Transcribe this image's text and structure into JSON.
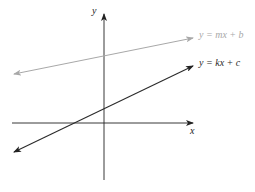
{
  "diagram": {
    "axes": {
      "x_label": "x",
      "y_label": "y",
      "color": "#222222"
    },
    "lines": [
      {
        "name": "gray-line",
        "label_parts": [
          "y",
          " = ",
          "mx",
          " + ",
          "b"
        ],
        "label": "y = mx + b",
        "color": "#a8a8a8"
      },
      {
        "name": "dark-line",
        "label_parts": [
          "y",
          " = ",
          "kx",
          " + ",
          "c"
        ],
        "label": "y = kx + c",
        "color": "#2a2a2a"
      }
    ]
  }
}
